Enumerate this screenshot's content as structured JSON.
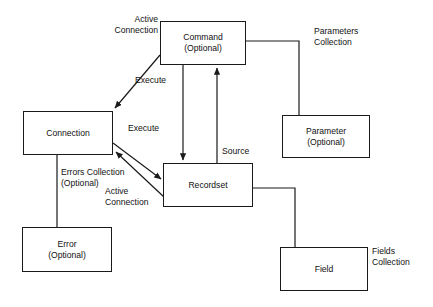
{
  "diagram": {
    "background_color": "#ffffff",
    "line_color": "#1a1a1a",
    "text_color": "#111111",
    "nodes": [
      {
        "id": "command",
        "label": "Command",
        "sublabel": "(Optional)",
        "x": 160,
        "y": 21,
        "w": 86,
        "h": 44
      },
      {
        "id": "connection",
        "label": "Connection",
        "sublabel": "",
        "x": 23,
        "y": 111,
        "w": 90,
        "h": 44
      },
      {
        "id": "recordset",
        "label": "Recordset",
        "sublabel": "",
        "x": 163,
        "y": 163,
        "w": 90,
        "h": 44
      },
      {
        "id": "parameter",
        "label": "Parameter",
        "sublabel": "(Optional)",
        "x": 282,
        "y": 115,
        "w": 88,
        "h": 43
      },
      {
        "id": "error",
        "label": "Error",
        "sublabel": "(Optional)",
        "x": 22,
        "y": 227,
        "w": 90,
        "h": 45
      },
      {
        "id": "field",
        "label": "Field",
        "sublabel": "",
        "x": 280,
        "y": 247,
        "w": 88,
        "h": 44
      }
    ],
    "edge_labels": [
      {
        "id": "active-connection-command",
        "text": "Active\nConnection",
        "x": 96,
        "y": 14,
        "w": 62,
        "align": "right"
      },
      {
        "id": "execute-command",
        "text": "Execute",
        "x": 135,
        "y": 75,
        "w": 46,
        "align": "left"
      },
      {
        "id": "parameters-collection",
        "text": "Parameters\nCollection",
        "x": 314,
        "y": 26,
        "w": 66,
        "align": "left"
      },
      {
        "id": "execute-connection",
        "text": "Execute",
        "x": 128,
        "y": 123,
        "w": 46,
        "align": "left"
      },
      {
        "id": "errors-collection",
        "text": "Errors Collection\n(Optional)",
        "x": 61,
        "y": 167,
        "w": 84,
        "align": "left"
      },
      {
        "id": "active-connection-rs",
        "text": "Active\nConnection",
        "x": 105,
        "y": 186,
        "w": 62,
        "align": "left"
      },
      {
        "id": "source",
        "text": "Source",
        "x": 222,
        "y": 146,
        "w": 42,
        "align": "left"
      },
      {
        "id": "fields-collection",
        "text": "Fields\nCollection",
        "x": 372,
        "y": 246,
        "w": 58,
        "align": "left"
      }
    ],
    "connectors": [
      {
        "id": "command-to-connection",
        "type": "arrow-single",
        "from": "command",
        "to": "connection",
        "label": "Active Connection"
      },
      {
        "id": "command-to-recordset",
        "type": "arrow-single",
        "from": "command",
        "to": "recordset",
        "label": "Execute"
      },
      {
        "id": "recordset-to-command",
        "type": "arrow-single",
        "from": "recordset",
        "to": "command",
        "label": "Source"
      },
      {
        "id": "connection-to-recordset",
        "type": "arrow-single",
        "from": "connection",
        "to": "recordset",
        "label": "Execute"
      },
      {
        "id": "recordset-to-connection",
        "type": "arrow-single",
        "from": "recordset",
        "to": "connection",
        "label": "Active Connection"
      },
      {
        "id": "command-to-parameter",
        "type": "elbow-plain",
        "from": "command",
        "to": "parameter",
        "label": "Parameters Collection"
      },
      {
        "id": "connection-to-error",
        "type": "line-plain",
        "from": "connection",
        "to": "error",
        "label": "Errors Collection (Optional)"
      },
      {
        "id": "recordset-to-field",
        "type": "elbow-plain",
        "from": "recordset",
        "to": "field",
        "label": "Fields Collection"
      }
    ]
  }
}
